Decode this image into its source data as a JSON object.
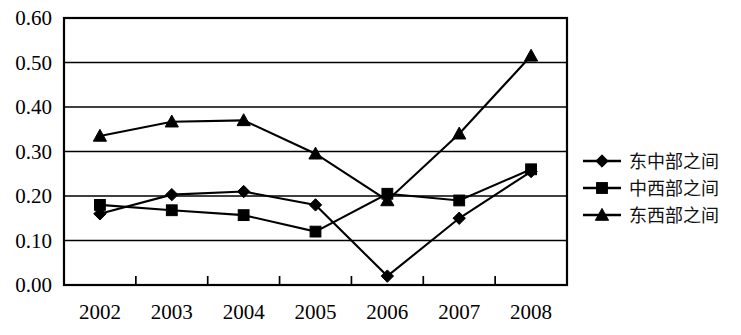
{
  "chart_data": {
    "type": "line",
    "title": "",
    "subtitle": "",
    "xlabel": "",
    "ylabel": "",
    "categories": [
      "2002",
      "2003",
      "2004",
      "2005",
      "2006",
      "2007",
      "2008"
    ],
    "ylim": [
      0.0,
      0.6
    ],
    "ytick_labels": [
      "0.60",
      "0.50",
      "0.40",
      "0.30",
      "0.20",
      "0.10",
      "0.00"
    ],
    "ytick_values": [
      0.6,
      0.5,
      0.4,
      0.3,
      0.2,
      0.1,
      0.0
    ],
    "grid": "horizontal",
    "legend_position": "right",
    "series": [
      {
        "name": "东中部之间",
        "marker": "diamond",
        "values": [
          0.16,
          0.203,
          0.21,
          0.18,
          0.02,
          0.15,
          0.255
        ]
      },
      {
        "name": "中西部之间",
        "marker": "square",
        "values": [
          0.18,
          0.168,
          0.157,
          0.12,
          0.205,
          0.19,
          0.26
        ]
      },
      {
        "name": "东西部之间",
        "marker": "triangle",
        "values": [
          0.335,
          0.367,
          0.37,
          0.295,
          0.19,
          0.34,
          0.515
        ]
      }
    ],
    "colors": {
      "series_line": "#000000",
      "marker": "#000000",
      "axis": "#000000",
      "grid": "#000000",
      "background": "#ffffff"
    }
  },
  "legend": {
    "entries": [
      {
        "label": "东中部之间",
        "marker": "diamond-marker-icon"
      },
      {
        "label": "中西部之间",
        "marker": "square-marker-icon"
      },
      {
        "label": "东西部之间",
        "marker": "triangle-marker-icon"
      }
    ]
  }
}
